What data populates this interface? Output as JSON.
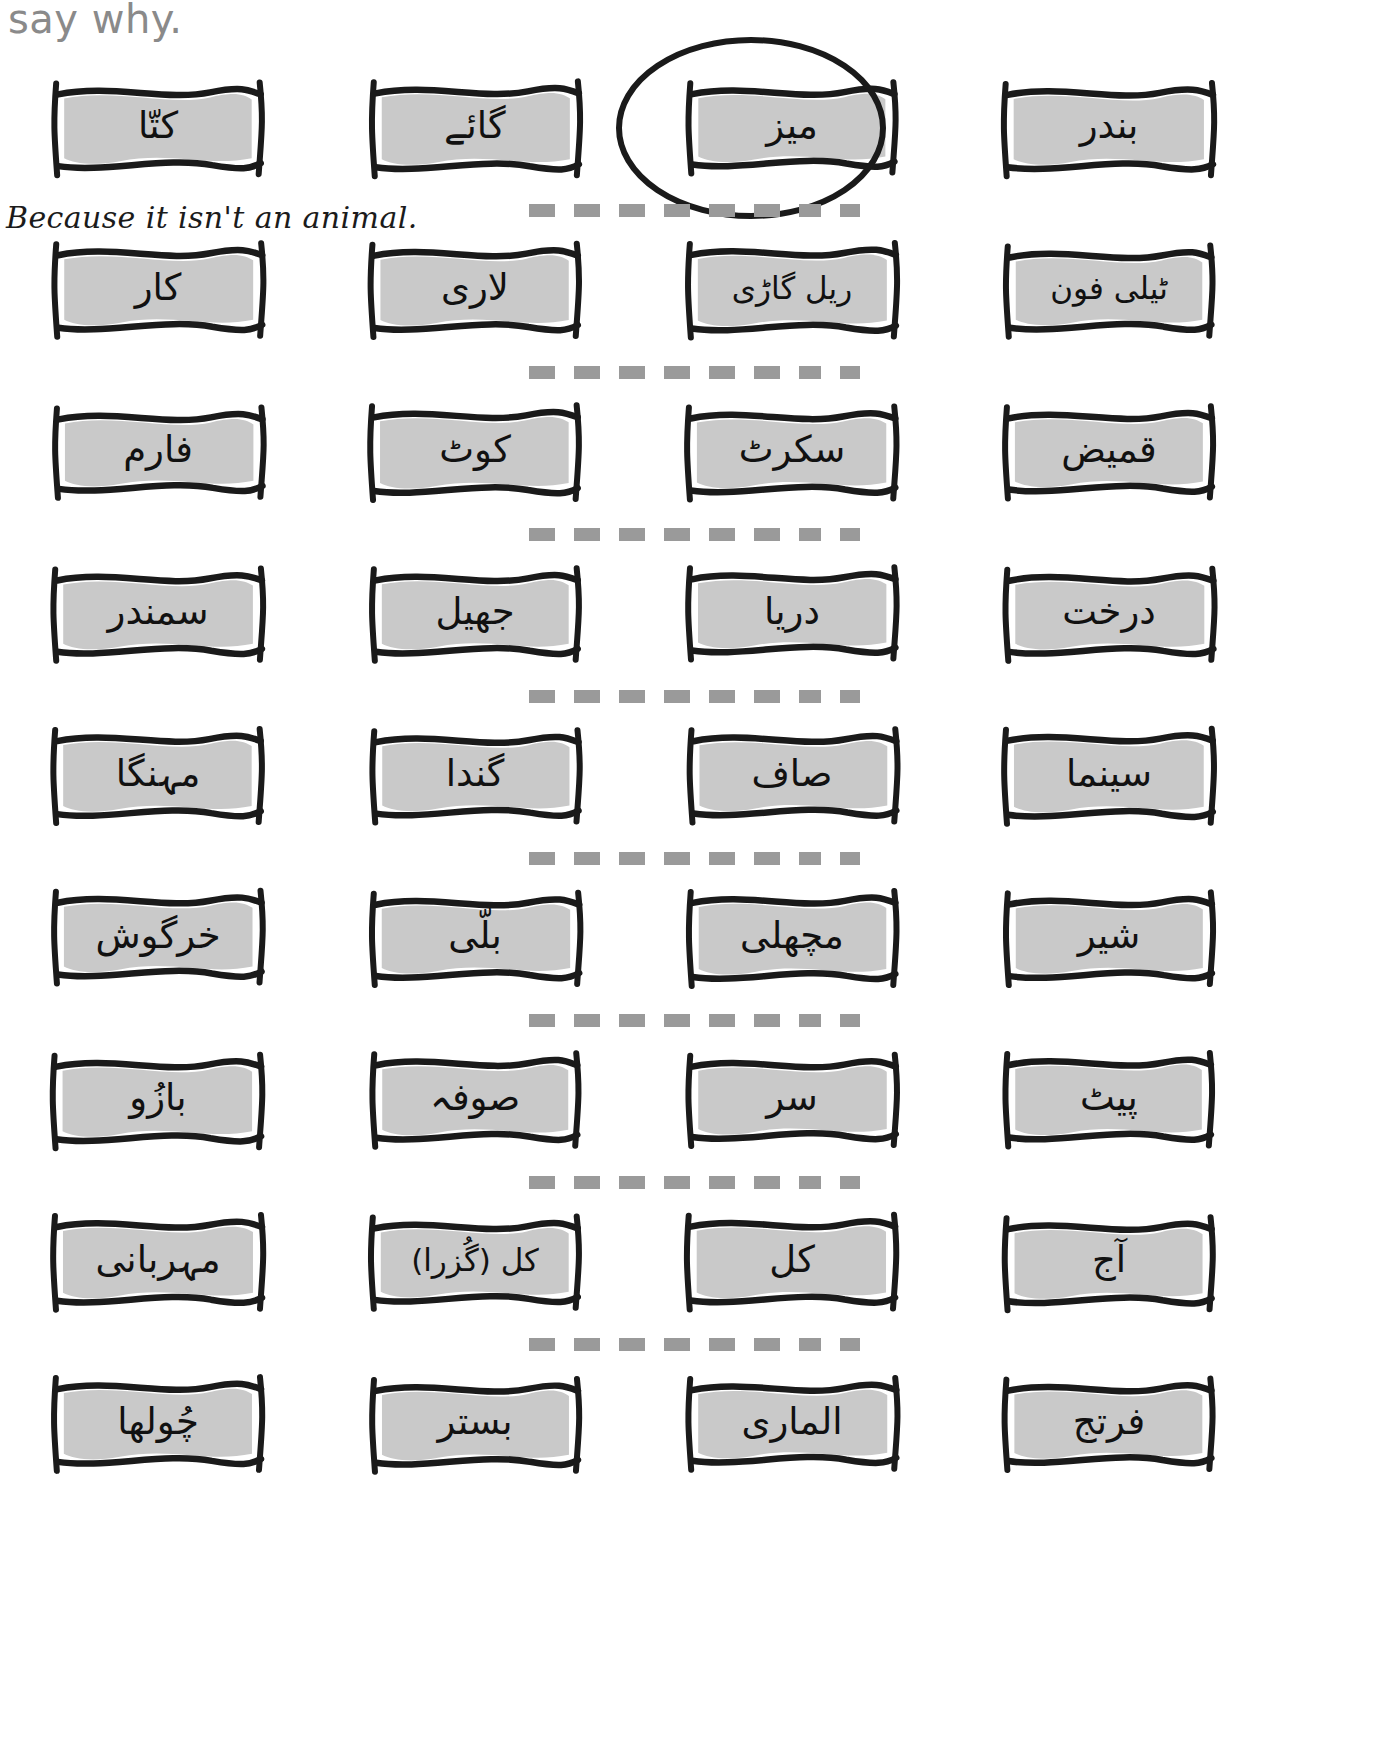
{
  "instruction": {
    "text": "say why."
  },
  "answer": {
    "handwritten": "Because it isn't an animal."
  },
  "separator": {
    "dash_count": 8,
    "color": "#9a9a9a"
  },
  "card_style": {
    "fill_color": "#c9c9c9",
    "border_color": "#1a1a1a",
    "circle_color": "#1a1a1a"
  },
  "rows": [
    {
      "id": "row-animals-1",
      "circled_index": 2,
      "cards": [
        {
          "word": "کتّا"
        },
        {
          "word": "گائے"
        },
        {
          "word": "میز"
        },
        {
          "word": "بندر"
        }
      ]
    },
    {
      "id": "row-transport",
      "circled_index": -1,
      "cards": [
        {
          "word": "کار"
        },
        {
          "word": "لاری"
        },
        {
          "word": "ریل گاڑی"
        },
        {
          "word": "ٹیلی فون"
        }
      ]
    },
    {
      "id": "row-clothes",
      "circled_index": -1,
      "cards": [
        {
          "word": "فارم"
        },
        {
          "word": "کوٹ"
        },
        {
          "word": "سکرٹ"
        },
        {
          "word": "قمیض"
        }
      ]
    },
    {
      "id": "row-nature",
      "circled_index": -1,
      "cards": [
        {
          "word": "سمندر"
        },
        {
          "word": "جھیل"
        },
        {
          "word": "دریا"
        },
        {
          "word": "درخت"
        }
      ]
    },
    {
      "id": "row-adjectives",
      "circled_index": -1,
      "cards": [
        {
          "word": "مہنگا"
        },
        {
          "word": "گندا"
        },
        {
          "word": "صاف"
        },
        {
          "word": "سینما"
        }
      ]
    },
    {
      "id": "row-animals-2",
      "circled_index": -1,
      "cards": [
        {
          "word": "خرگوش"
        },
        {
          "word": "بلّی"
        },
        {
          "word": "مچھلی"
        },
        {
          "word": "شیر"
        }
      ]
    },
    {
      "id": "row-body",
      "circled_index": -1,
      "cards": [
        {
          "word": "بازُو"
        },
        {
          "word": "صوفہ"
        },
        {
          "word": "سر"
        },
        {
          "word": "پیٹ"
        }
      ]
    },
    {
      "id": "row-time",
      "circled_index": -1,
      "cards": [
        {
          "word": "مہربانی"
        },
        {
          "word": "کل (گُزرا)"
        },
        {
          "word": "کل"
        },
        {
          "word": "آج"
        }
      ]
    },
    {
      "id": "row-furniture",
      "circled_index": -1,
      "cards": [
        {
          "word": "چُولھا"
        },
        {
          "word": "بستر"
        },
        {
          "word": "الماری"
        },
        {
          "word": "فرتج"
        }
      ]
    }
  ]
}
